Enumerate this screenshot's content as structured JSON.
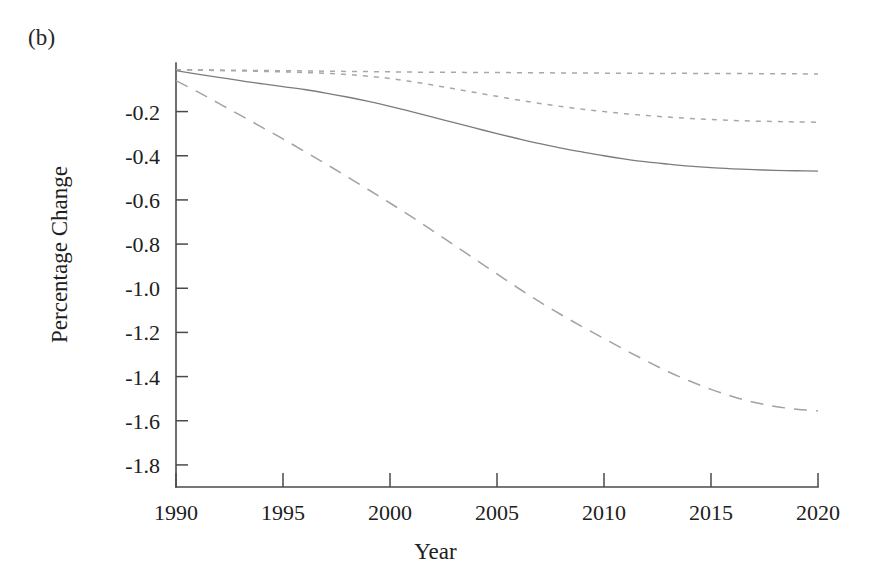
{
  "figure": {
    "panel_label": "(b)",
    "background_color": "#ffffff",
    "width": 871,
    "height": 587
  },
  "chart_data": {
    "type": "line",
    "title": "",
    "subtitle": "",
    "panel": "(b)",
    "xlabel": "Year",
    "ylabel": "Percentage Change",
    "xlim": [
      1990,
      2020
    ],
    "ylim": [
      -1.9,
      0.02
    ],
    "grid": false,
    "legend": null,
    "legend_position": "none",
    "x_ticks": [
      1990,
      1995,
      2000,
      2005,
      2010,
      2015,
      2020
    ],
    "x_tick_labels": [
      "1990",
      "1995",
      "2000",
      "2005",
      "2010",
      "2015",
      "2020"
    ],
    "y_ticks": [
      -0.2,
      -0.4,
      -0.6,
      -0.8,
      -1.0,
      -1.2,
      -1.4,
      -1.6,
      -1.8
    ],
    "y_tick_labels": [
      "-0.2",
      "-0.4",
      "-0.6",
      "-0.8",
      "-1.0",
      "-1.2",
      "-1.4",
      "-1.6",
      "-1.8"
    ],
    "x": [
      1990,
      1991,
      1992,
      1993,
      1994,
      1995,
      1996,
      1997,
      1998,
      1999,
      2000,
      2001,
      2002,
      2003,
      2004,
      2005,
      2006,
      2007,
      2008,
      2009,
      2010,
      2011,
      2012,
      2013,
      2014,
      2015,
      2016,
      2017,
      2018,
      2019,
      2020
    ],
    "series": [
      {
        "name": "series-dotted-flat",
        "style": "dotted",
        "color": "#a8a8a8",
        "values": [
          -0.01,
          -0.011,
          -0.012,
          -0.013,
          -0.014,
          -0.015,
          -0.016,
          -0.017,
          -0.018,
          -0.019,
          -0.02,
          -0.021,
          -0.022,
          -0.022,
          -0.023,
          -0.023,
          -0.024,
          -0.024,
          -0.025,
          -0.025,
          -0.026,
          -0.026,
          -0.027,
          -0.027,
          -0.027,
          -0.028,
          -0.028,
          -0.028,
          -0.029,
          -0.029,
          -0.03
        ]
      },
      {
        "name": "series-dotted-declining",
        "style": "dotted",
        "color": "#a8a8a8",
        "values": [
          -0.01,
          -0.012,
          -0.014,
          -0.016,
          -0.018,
          -0.02,
          -0.023,
          -0.027,
          -0.032,
          -0.04,
          -0.05,
          -0.064,
          -0.08,
          -0.097,
          -0.114,
          -0.131,
          -0.148,
          -0.163,
          -0.177,
          -0.189,
          -0.2,
          -0.21,
          -0.218,
          -0.225,
          -0.231,
          -0.236,
          -0.24,
          -0.243,
          -0.245,
          -0.247,
          -0.248
        ]
      },
      {
        "name": "series-solid",
        "style": "solid",
        "color": "#7c7c7c",
        "values": [
          -0.015,
          -0.03,
          -0.045,
          -0.06,
          -0.074,
          -0.087,
          -0.1,
          -0.116,
          -0.134,
          -0.154,
          -0.176,
          -0.2,
          -0.225,
          -0.25,
          -0.275,
          -0.3,
          -0.323,
          -0.345,
          -0.365,
          -0.383,
          -0.4,
          -0.415,
          -0.428,
          -0.438,
          -0.447,
          -0.454,
          -0.459,
          -0.463,
          -0.466,
          -0.468,
          -0.47
        ]
      },
      {
        "name": "series-dashed",
        "style": "dashed",
        "color": "#a2a2a2",
        "values": [
          -0.06,
          -0.11,
          -0.163,
          -0.216,
          -0.27,
          -0.324,
          -0.38,
          -0.437,
          -0.495,
          -0.554,
          -0.614,
          -0.676,
          -0.74,
          -0.805,
          -0.87,
          -0.935,
          -1.0,
          -1.062,
          -1.12,
          -1.175,
          -1.228,
          -1.28,
          -1.33,
          -1.378,
          -1.42,
          -1.458,
          -1.49,
          -1.516,
          -1.535,
          -1.548,
          -1.555
        ]
      }
    ]
  },
  "axes": {
    "x_axis_name": "year-axis",
    "y_axis_name": "percentage-change-axis"
  }
}
